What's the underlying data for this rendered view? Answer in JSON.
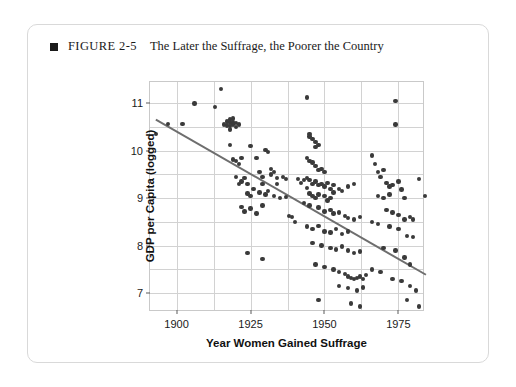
{
  "figure": {
    "marker": "square-bullet",
    "number": "FIGURE 2-5",
    "title": "The Later the Suffrage, the Poorer the Country"
  },
  "chart_data": {
    "type": "scatter",
    "title": "The Later the Suffrage, the Poorer the Country",
    "xlabel": "Year Women Gained Suffrage",
    "ylabel": "GDP per Capita (logged)",
    "xlim": [
      1891,
      1984
    ],
    "ylim": [
      6.6,
      11.45
    ],
    "xticks": [
      1900,
      1925,
      1950,
      1975
    ],
    "yticks": [
      7,
      8,
      9,
      10,
      11
    ],
    "grid": true,
    "legend": null,
    "point_color": "#3a3a3a",
    "trend_color": "#6e6e6e",
    "trendline": {
      "type": "linear-fit",
      "x_start": 1893,
      "y_start": 10.65,
      "x_end": 1985,
      "y_end": 7.35,
      "slope_per_year": -0.0359
    },
    "points": [
      [
        1893,
        10.35
      ],
      [
        1897,
        10.57
      ],
      [
        1902,
        10.57
      ],
      [
        1906,
        11.0
      ],
      [
        1913,
        10.92
      ],
      [
        1915,
        11.3
      ],
      [
        1916,
        10.55
      ],
      [
        1917,
        10.53
      ],
      [
        1917,
        10.62
      ],
      [
        1918,
        10.6
      ],
      [
        1918,
        10.52
      ],
      [
        1918,
        10.66
      ],
      [
        1918,
        10.45
      ],
      [
        1919,
        10.6
      ],
      [
        1919,
        10.55
      ],
      [
        1919,
        10.68
      ],
      [
        1920,
        10.58
      ],
      [
        1920,
        10.5
      ],
      [
        1921,
        10.55
      ],
      [
        1918,
        10.12
      ],
      [
        1919,
        9.82
      ],
      [
        1920,
        9.78
      ],
      [
        1921,
        9.72
      ],
      [
        1922,
        9.85
      ],
      [
        1920,
        9.45
      ],
      [
        1921,
        9.3
      ],
      [
        1922,
        9.35
      ],
      [
        1923,
        9.42
      ],
      [
        1924,
        9.3
      ],
      [
        1925,
        10.1
      ],
      [
        1927,
        9.85
      ],
      [
        1928,
        9.55
      ],
      [
        1929,
        9.45
      ],
      [
        1929,
        9.3
      ],
      [
        1930,
        10.02
      ],
      [
        1931,
        9.98
      ],
      [
        1932,
        9.62
      ],
      [
        1932,
        9.5
      ],
      [
        1933,
        9.55
      ],
      [
        1934,
        9.42
      ],
      [
        1934,
        9.3
      ],
      [
        1936,
        9.45
      ],
      [
        1937,
        9.4
      ],
      [
        1924,
        9.1
      ],
      [
        1925,
        9.05
      ],
      [
        1926,
        9.2
      ],
      [
        1928,
        9.12
      ],
      [
        1930,
        9.08
      ],
      [
        1931,
        9.15
      ],
      [
        1933,
        9.05
      ],
      [
        1935,
        9.0
      ],
      [
        1937,
        9.02
      ],
      [
        1922,
        8.82
      ],
      [
        1923,
        8.72
      ],
      [
        1925,
        8.78
      ],
      [
        1927,
        8.68
      ],
      [
        1929,
        8.85
      ],
      [
        1938,
        8.62
      ],
      [
        1939,
        8.6
      ],
      [
        1940,
        8.5
      ],
      [
        1924,
        7.85
      ],
      [
        1929,
        7.72
      ],
      [
        1944,
        11.12
      ],
      [
        1945,
        10.35
      ],
      [
        1945,
        10.3
      ],
      [
        1946,
        10.25
      ],
      [
        1947,
        10.18
      ],
      [
        1947,
        10.08
      ],
      [
        1948,
        10.12
      ],
      [
        1944,
        9.85
      ],
      [
        1945,
        9.78
      ],
      [
        1946,
        9.75
      ],
      [
        1947,
        9.68
      ],
      [
        1948,
        9.6
      ],
      [
        1949,
        9.62
      ],
      [
        1950,
        9.55
      ],
      [
        1944,
        9.42
      ],
      [
        1945,
        9.38
      ],
      [
        1946,
        9.3
      ],
      [
        1947,
        9.35
      ],
      [
        1948,
        9.28
      ],
      [
        1949,
        9.3
      ],
      [
        1950,
        9.25
      ],
      [
        1951,
        9.32
      ],
      [
        1952,
        9.2
      ],
      [
        1953,
        9.28
      ],
      [
        1941,
        9.4
      ],
      [
        1942,
        9.32
      ],
      [
        1943,
        9.38
      ],
      [
        1944,
        9.22
      ],
      [
        1945,
        9.1
      ],
      [
        1946,
        9.05
      ],
      [
        1947,
        9.0
      ],
      [
        1948,
        9.08
      ],
      [
        1950,
        9.05
      ],
      [
        1951,
        8.95
      ],
      [
        1952,
        9.0
      ],
      [
        1953,
        9.12
      ],
      [
        1955,
        9.2
      ],
      [
        1956,
        9.15
      ],
      [
        1958,
        9.25
      ],
      [
        1960,
        9.3
      ],
      [
        1943,
        8.9
      ],
      [
        1945,
        8.85
      ],
      [
        1948,
        8.8
      ],
      [
        1950,
        8.72
      ],
      [
        1952,
        8.75
      ],
      [
        1953,
        8.68
      ],
      [
        1955,
        8.7
      ],
      [
        1957,
        8.62
      ],
      [
        1958,
        8.58
      ],
      [
        1960,
        8.55
      ],
      [
        1962,
        8.6
      ],
      [
        1944,
        8.4
      ],
      [
        1946,
        8.35
      ],
      [
        1948,
        8.42
      ],
      [
        1950,
        8.3
      ],
      [
        1952,
        8.28
      ],
      [
        1954,
        8.35
      ],
      [
        1956,
        8.25
      ],
      [
        1958,
        8.3
      ],
      [
        1946,
        8.05
      ],
      [
        1949,
        8.0
      ],
      [
        1952,
        7.95
      ],
      [
        1954,
        7.92
      ],
      [
        1956,
        7.98
      ],
      [
        1958,
        7.9
      ],
      [
        1960,
        7.85
      ],
      [
        1962,
        7.88
      ],
      [
        1947,
        7.6
      ],
      [
        1950,
        7.55
      ],
      [
        1953,
        7.5
      ],
      [
        1955,
        7.45
      ],
      [
        1957,
        7.4
      ],
      [
        1958,
        7.35
      ],
      [
        1959,
        7.32
      ],
      [
        1960,
        7.3
      ],
      [
        1961,
        7.32
      ],
      [
        1962,
        7.35
      ],
      [
        1963,
        7.3
      ],
      [
        1964,
        7.38
      ],
      [
        1955,
        7.15
      ],
      [
        1958,
        7.1
      ],
      [
        1961,
        7.05
      ],
      [
        1963,
        7.12
      ],
      [
        1948,
        6.85
      ],
      [
        1959,
        6.78
      ],
      [
        1962,
        6.72
      ],
      [
        1966,
        9.9
      ],
      [
        1967,
        9.72
      ],
      [
        1968,
        9.55
      ],
      [
        1969,
        9.45
      ],
      [
        1970,
        9.6
      ],
      [
        1971,
        9.32
      ],
      [
        1972,
        9.25
      ],
      [
        1973,
        9.28
      ],
      [
        1968,
        9.05
      ],
      [
        1970,
        9.0
      ],
      [
        1972,
        9.08
      ],
      [
        1974,
        11.05
      ],
      [
        1974,
        10.55
      ],
      [
        1975,
        9.35
      ],
      [
        1976,
        9.18
      ],
      [
        1977,
        9.0
      ],
      [
        1971,
        8.75
      ],
      [
        1973,
        8.7
      ],
      [
        1975,
        8.65
      ],
      [
        1977,
        8.55
      ],
      [
        1979,
        8.6
      ],
      [
        1980,
        8.55
      ],
      [
        1966,
        8.5
      ],
      [
        1968,
        8.45
      ],
      [
        1972,
        8.4
      ],
      [
        1975,
        8.35
      ],
      [
        1978,
        8.2
      ],
      [
        1980,
        8.18
      ],
      [
        1970,
        7.95
      ],
      [
        1974,
        7.9
      ],
      [
        1977,
        7.75
      ],
      [
        1979,
        7.6
      ],
      [
        1966,
        7.5
      ],
      [
        1969,
        7.45
      ],
      [
        1973,
        7.3
      ],
      [
        1976,
        7.25
      ],
      [
        1979,
        7.15
      ],
      [
        1981,
        7.05
      ],
      [
        1978,
        6.85
      ],
      [
        1982,
        6.72
      ],
      [
        1984,
        9.05
      ],
      [
        1982,
        9.4
      ]
    ]
  }
}
